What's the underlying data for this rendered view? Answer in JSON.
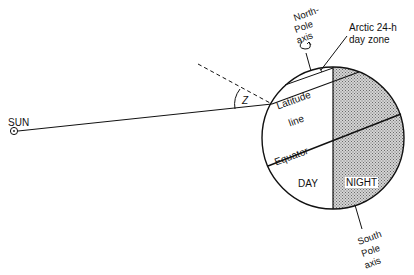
{
  "diagram": {
    "type": "Earth illumination / solar zenith angle diagram",
    "labels": {
      "sun": "SUN",
      "north_pole_line1": "North-",
      "north_pole_line2": "Pole",
      "north_pole_line3": "axis",
      "arctic_line1": "Arctic 24-h",
      "arctic_line2": "day zone",
      "angle": "Z",
      "latitude_line1": "Latitude",
      "latitude_line2": "line",
      "equator": "Equator",
      "day": "DAY",
      "night": "NIGHT",
      "south_pole_line1": "South",
      "south_pole_line2": "Pole",
      "south_pole_line3": "axis"
    },
    "colors": {
      "line": "#111111",
      "night_shade": "#a9a9a9",
      "background": "#ffffff"
    }
  }
}
